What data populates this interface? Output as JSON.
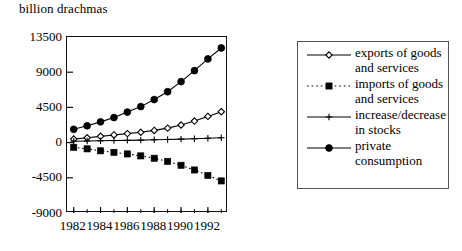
{
  "chart_data": {
    "type": "line",
    "title": "",
    "subtitle": "",
    "unit_label": "billion drachmas",
    "xlabel": "",
    "ylabel": "billion drachmas",
    "x": [
      1982,
      1983,
      1984,
      1985,
      1986,
      1987,
      1988,
      1989,
      1990,
      1991,
      1992,
      1993
    ],
    "categories": [
      "1982",
      "1983",
      "1984",
      "1985",
      "1986",
      "1987",
      "1988",
      "1989",
      "1990",
      "1991",
      "1992",
      "1993"
    ],
    "xtick_labels": [
      "1982",
      "1984",
      "1986",
      "1988",
      "1990",
      "1992"
    ],
    "xtick_values": [
      1982,
      1984,
      1986,
      1988,
      1990,
      1992
    ],
    "ytick_labels": [
      "13500",
      "9000",
      "4500",
      "0",
      "-4500",
      "-9000"
    ],
    "ytick_values": [
      13500,
      9000,
      4500,
      0,
      -4500,
      -9000
    ],
    "ylim": [
      -9000,
      13500
    ],
    "xlim": [
      1981.5,
      1993.5
    ],
    "grid": false,
    "legend_position": "right",
    "series": [
      {
        "name": "exports of goods and services",
        "label_lines": "exports of goods\nand services",
        "marker": "open-diamond",
        "line_style": "solid",
        "color": "#000000",
        "values": [
          450,
          620,
          800,
          980,
          1150,
          1320,
          1560,
          1850,
          2250,
          2750,
          3350,
          3950
        ]
      },
      {
        "name": "imports of goods and services",
        "label_lines": "imports of goods\nand services",
        "marker": "filled-square",
        "line_style": "dotted",
        "color": "#000000",
        "values": [
          -600,
          -800,
          -1050,
          -1250,
          -1450,
          -1700,
          -2000,
          -2400,
          -2900,
          -3500,
          -4200,
          -4900
        ]
      },
      {
        "name": "increase/decrease in stocks",
        "label_lines": "increase/decrease\nin stocks",
        "marker": "plus",
        "line_style": "solid",
        "color": "#000000",
        "values": [
          180,
          200,
          230,
          260,
          290,
          320,
          360,
          400,
          450,
          500,
          560,
          620
        ]
      },
      {
        "name": "private consumption",
        "label_lines": "private\nconsumption",
        "marker": "filled-circle",
        "line_style": "solid",
        "color": "#000000",
        "values": [
          1700,
          2150,
          2650,
          3200,
          3900,
          4600,
          5500,
          6500,
          7800,
          9200,
          10700,
          12100
        ]
      }
    ]
  },
  "legend": {
    "items": [
      {
        "label": "exports of goods\nand services",
        "marker": "open-diamond",
        "line_style": "solid"
      },
      {
        "label": "imports of goods\nand services",
        "marker": "filled-square",
        "line_style": "dotted"
      },
      {
        "label": "increase/decrease\nin stocks",
        "marker": "plus",
        "line_style": "solid"
      },
      {
        "label": "private\nconsumption",
        "marker": "filled-circle",
        "line_style": "solid"
      }
    ]
  }
}
